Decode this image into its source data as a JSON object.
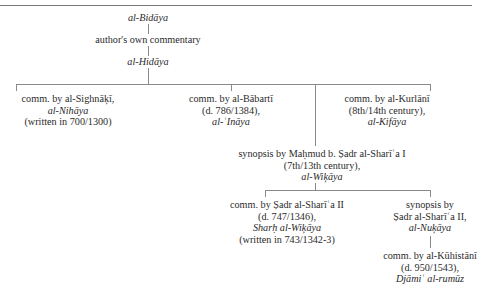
{
  "diagram": {
    "root": {
      "title": "al-Bidāya"
    },
    "link1": {
      "label": "author's own commentary"
    },
    "hidaya": {
      "title": "al-Hidāya"
    },
    "sighnaki": {
      "line1": "comm. by al-Sighnāķī,",
      "title": "al-Nihāya",
      "line3": "(written in 700/1300)"
    },
    "babarti": {
      "line1": "comm. by al-Bābartī",
      "line2": "(d. 786/1384),",
      "title": "al-ʿInāya"
    },
    "kurlani": {
      "line1": "comm. by al-Kurlānī",
      "line2": "(8th/14th century),",
      "title": "al-Kifāya"
    },
    "wikaya": {
      "line1": "synopsis by Maḥmud b. Ṣadr al-Sharīʿa I",
      "line2": "(7th/13th century),",
      "title": "al-Wiķāya"
    },
    "sharh": {
      "line1": "comm. by Ṣadr al-Sharīʿa II",
      "line2": "(d. 747/1346),",
      "title": "Sharḥ al-Wiķāya",
      "line4": "(written in 743/1342-3)"
    },
    "nukaya": {
      "line1": "synopsis by",
      "line2": "Ṣadr al-Sharīʿa II,",
      "title": "al-Nuķāya"
    },
    "kuhistani": {
      "line1": "comm. by al-Kūhistānī",
      "line2": "(d. 950/1543),",
      "title": "Djāmiʿ al-rumūz"
    }
  }
}
